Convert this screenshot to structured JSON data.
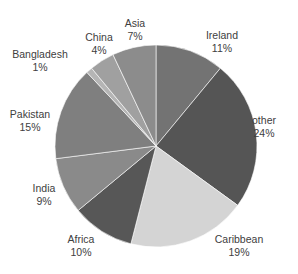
{
  "chart_data": {
    "type": "pie",
    "title": "",
    "start_angle_deg": 0,
    "direction": "clockwise",
    "center": [
      156,
      146
    ],
    "radius": 101,
    "categories": [
      "Ireland",
      "other",
      "Caribbean",
      "Africa",
      "India",
      "Pakistan",
      "Bangladesh",
      "China",
      "Asia"
    ],
    "values": [
      11,
      24,
      19,
      10,
      9,
      15,
      1,
      4,
      7
    ],
    "value_labels": [
      "11%",
      "24%",
      "19%",
      "10%",
      "9%",
      "15%",
      "1%",
      "4%",
      "7%"
    ],
    "colors": [
      "#737373",
      "#555555",
      "#d4d4d4",
      "#575757",
      "#8a8a8a",
      "#7f7f7f",
      "#b5b5b5",
      "#a0a0a0",
      "#8c8c8c"
    ],
    "label_positions": [
      [
        222,
        41
      ],
      [
        264,
        126
      ],
      [
        239,
        245
      ],
      [
        81,
        245
      ],
      [
        44,
        194
      ],
      [
        30,
        120
      ],
      [
        40,
        60
      ],
      [
        99,
        43
      ],
      [
        135,
        29
      ]
    ],
    "legend": "none (data labels outside slices)"
  }
}
